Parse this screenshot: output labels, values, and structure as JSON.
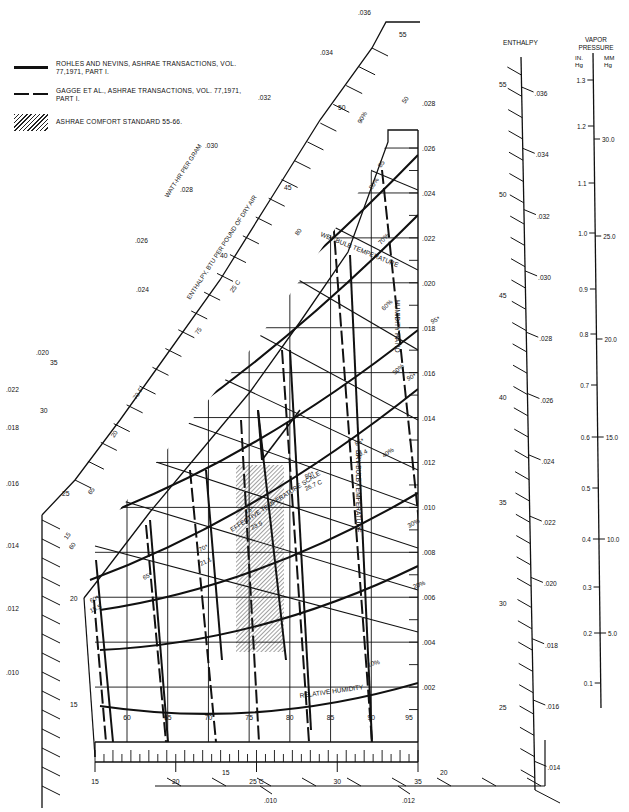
{
  "chart_data": {
    "type": "psychrometric",
    "title": "",
    "legend": [
      {
        "style": "solid",
        "label": "ROHLES AND NEVINS, ASHRAE TRANSACTIONS, VOL. 77,1971, PART I."
      },
      {
        "style": "dashed",
        "label": "GAGGE ET AL., ASHRAE TRANSACTIONS, VOL. 77,1971, PART I."
      },
      {
        "style": "hatched",
        "label": "ASHRAE COMFORT STANDARD 55-66."
      }
    ],
    "axes": {
      "dry_bulb_f": {
        "label": "DRY-BULB TEMPERATURE",
        "ticks": [
          60,
          65,
          70,
          75,
          80,
          85,
          90,
          95
        ]
      },
      "dry_bulb_c": {
        "ticks": [
          "15",
          "20",
          "25 C",
          "30",
          "35"
        ]
      },
      "humidity_ratio": {
        "label": "HUMIDITY RATIO",
        "ticks": [
          ".002",
          ".004",
          ".006",
          ".008",
          ".010",
          ".012",
          ".014",
          ".016",
          ".018",
          ".020",
          ".022",
          ".024",
          ".026",
          ".028"
        ]
      },
      "wet_bulb": {
        "label": "WET-BULB TEMPERATURE",
        "ticks_f": [
          "60",
          "65",
          "70 F",
          "75",
          "80",
          "85",
          "90"
        ],
        "ticks_c": [
          "15",
          "20",
          "25 C"
        ]
      },
      "enthalpy_btu": {
        "label": "ENTHALPY, BTU PER POUND OF DRY AIR",
        "ticks": [
          "15",
          "20",
          "25",
          "30",
          "35",
          "40",
          "45",
          "50",
          "55"
        ]
      },
      "enthalpy_wh": {
        "label": "WATT-HR PER GRAM",
        "ticks": [
          ".010",
          ".012",
          ".014",
          ".016",
          ".018",
          ".020",
          ".022",
          ".024",
          ".026",
          ".028",
          ".030",
          ".032",
          ".034",
          ".036"
        ]
      },
      "relative_humidity": {
        "label": "RELATIVE HUMIDITY",
        "curves": [
          "10%",
          "20%",
          "30%",
          "40%",
          "50%",
          "60%",
          "70%",
          "80%",
          "90%"
        ]
      },
      "effective_temperature": {
        "label": "EFFECTIVE TEMPERATURE SCALE",
        "points": [
          {
            "f": "60*",
            "c": "15.5"
          },
          {
            "f": "65*",
            "c": ""
          },
          {
            "f": "70*",
            "c": "21.1"
          },
          {
            "f": "75*",
            "c": "23.9"
          },
          {
            "f": "80*",
            "c": "26.7 C"
          },
          {
            "f": "85*",
            "c": "29.4"
          },
          {
            "f": "90*",
            "c": ""
          },
          {
            "f": "95*",
            "c": ""
          }
        ]
      }
    },
    "right_scales": {
      "enthalpy": {
        "label": "ENTHALPY",
        "btu_ticks": [
          "25",
          "30",
          "35",
          "40",
          "45",
          "50",
          "55"
        ],
        "wh_ticks": [
          ".014",
          ".016",
          ".018",
          ".020",
          ".022",
          ".024",
          ".026",
          ".028",
          ".030",
          ".032",
          ".034",
          ".036"
        ]
      },
      "vapor_pressure": {
        "label": "VAPOR PRESSURE",
        "in_hg_label": "IN. Hg",
        "mm_hg_label": "MM Hg",
        "in_hg_ticks": [
          "0.1",
          "0.2",
          "0.3",
          "0.4",
          "0.5",
          "0.6",
          "0.7",
          "0.8",
          "0.9",
          "1.0",
          "1.1",
          "1.2",
          "1.3"
        ],
        "mm_hg_ticks": [
          "5.0",
          "10.0",
          "15.0",
          "20.0",
          "25.0",
          "30.0"
        ]
      }
    },
    "bottom_scale": {
      "btu_ticks": [
        "15",
        "20"
      ],
      "wh_ticks": [
        ".010",
        ".012"
      ]
    },
    "comfort_zone": {
      "label": "ASHRAE COMFORT STANDARD 55-66",
      "x_range_px": [
        234,
        286
      ],
      "y_range_px": [
        465,
        652
      ]
    }
  },
  "labels": {
    "enthalpy_right": "ENTHALPY",
    "vapor_pressure_1": "VAPOR",
    "vapor_pressure_2": "PRESSURE",
    "in_hg_1": "IN.",
    "in_hg_2": "Hg",
    "mm_hg_1": "MM",
    "mm_hg_2": "Hg",
    "watt_hr": "WATT-HR PER GRAM",
    "enthalpy_diag": "ENTHALPY, BTU PER POUND OF DRY AIR",
    "wet_bulb": "WET-BULB TEMPERATURE",
    "humidity_ratio": "HUMIDITY RATIO",
    "dry_bulb": "DRY-BULB TEMPERATURE",
    "relative_humidity": "RELATIVE HUMIDITY",
    "effective_temp": "EFFECTIVE TEMPERATURE SCALE"
  }
}
